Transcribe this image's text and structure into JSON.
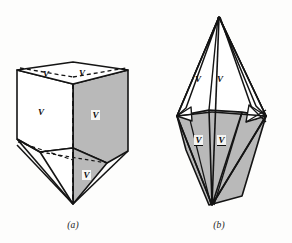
{
  "figure": {
    "background_color": "#fdfdfc",
    "ink_color": "#141414",
    "shade_color": "#b9b9b9",
    "white_face_color": "#ffffff",
    "panels": [
      {
        "id": "a",
        "caption": "(a)",
        "shape_name": "triangular-prism-with-apex",
        "labels": [
          {
            "name": "label-a-top-left",
            "text": "V",
            "style": "plain",
            "x": 47,
            "y": 74
          },
          {
            "name": "label-a-top-right",
            "text": "V",
            "style": "plain",
            "x": 83,
            "y": 73
          },
          {
            "name": "label-a-left-face",
            "text": "V",
            "style": "plain",
            "x": 41,
            "y": 112
          },
          {
            "name": "label-a-right-face",
            "text": "V",
            "style": "boxed",
            "x": 94,
            "y": 115
          },
          {
            "name": "label-a-bottom",
            "text": "V",
            "style": "boxed",
            "x": 85,
            "y": 175
          }
        ]
      },
      {
        "id": "b",
        "caption": "(b)",
        "shape_name": "bipyramid-double-cone",
        "labels": [
          {
            "name": "label-b-upper-left",
            "text": "V",
            "style": "plain",
            "x": 52,
            "y": 80
          },
          {
            "name": "label-b-upper-right",
            "text": "V",
            "style": "plain",
            "x": 74,
            "y": 80
          },
          {
            "name": "label-b-lower-left",
            "text": "V",
            "style": "barred",
            "x": 52,
            "y": 140
          },
          {
            "name": "label-b-lower-right",
            "text": "V",
            "style": "barred",
            "x": 74,
            "y": 140
          }
        ]
      }
    ]
  }
}
